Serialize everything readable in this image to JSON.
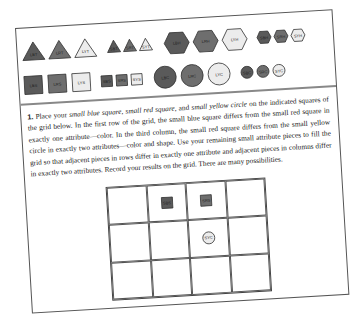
{
  "colors": {
    "blue": "#5a5a5a",
    "red": "#6e6e6e",
    "yellow": "#ececec",
    "stroke": "#333333"
  },
  "shapes_panel": {
    "row1": [
      {
        "label": "LBT",
        "shape": "triangle",
        "size": "large",
        "color": "blue"
      },
      {
        "label": "LRT",
        "shape": "triangle",
        "size": "large",
        "color": "red"
      },
      {
        "label": "LYT",
        "shape": "triangle",
        "size": "large",
        "color": "yellow"
      },
      {
        "label": "SBT",
        "shape": "triangle",
        "size": "small",
        "color": "blue"
      },
      {
        "label": "SRT",
        "shape": "triangle",
        "size": "small",
        "color": "red"
      },
      {
        "label": "SYT",
        "shape": "triangle",
        "size": "small",
        "color": "yellow"
      },
      {
        "label": "LBH",
        "shape": "hexagon",
        "size": "large",
        "color": "blue"
      },
      {
        "label": "LRH",
        "shape": "hexagon",
        "size": "large",
        "color": "red"
      },
      {
        "label": "LYH",
        "shape": "hexagon",
        "size": "large",
        "color": "yellow"
      },
      {
        "label": "SBH",
        "shape": "hexagon",
        "size": "small",
        "color": "blue"
      },
      {
        "label": "SRH",
        "shape": "hexagon",
        "size": "small",
        "color": "red"
      },
      {
        "label": "SYH",
        "shape": "hexagon",
        "size": "small",
        "color": "yellow"
      }
    ],
    "row2": [
      {
        "label": "LBS",
        "shape": "square",
        "size": "large",
        "color": "blue"
      },
      {
        "label": "LRS",
        "shape": "square",
        "size": "large",
        "color": "red"
      },
      {
        "label": "LYS",
        "shape": "square",
        "size": "large",
        "color": "yellow"
      },
      {
        "label": "SBS",
        "shape": "square",
        "size": "small",
        "color": "blue"
      },
      {
        "label": "SRS",
        "shape": "square",
        "size": "small",
        "color": "red"
      },
      {
        "label": "SYS",
        "shape": "square",
        "size": "small",
        "color": "yellow"
      },
      {
        "label": "LBC",
        "shape": "circle",
        "size": "large",
        "color": "blue"
      },
      {
        "label": "LRC",
        "shape": "circle",
        "size": "large",
        "color": "red"
      },
      {
        "label": "LYC",
        "shape": "circle",
        "size": "large",
        "color": "yellow"
      },
      {
        "label": "SBC",
        "shape": "circle",
        "size": "small",
        "color": "blue"
      },
      {
        "label": "SRC",
        "shape": "circle",
        "size": "small",
        "color": "red"
      },
      {
        "label": "SYC",
        "shape": "circle",
        "size": "small",
        "color": "yellow"
      }
    ]
  },
  "exercise": {
    "number": "1.",
    "intro": "Place your ",
    "item1": "small blue square",
    "sep1": ", ",
    "item2": "small red square",
    "sep2": ", and ",
    "item3": "small yellow circle",
    "body": " on the indicated squares of the grid below. In the first row of the grid, the small blue square differs from the small red square in exactly one attribute—color. In the third column, the small red square differs from the small yellow circle in exactly two attributes—color and shape. Use your remaining small attribute pieces to fill the grid so that adjacent pieces in rows differ in exactly one attribute and adjacent pieces in columns differ in exactly two attributes. Record your results on the grid. There are many possibilities."
  },
  "grid": {
    "rows": 3,
    "cols": 4,
    "cells": [
      [
        "",
        "SBS",
        "SRS",
        ""
      ],
      [
        "",
        "",
        "SYC",
        ""
      ],
      [
        "",
        "",
        "",
        ""
      ]
    ]
  }
}
